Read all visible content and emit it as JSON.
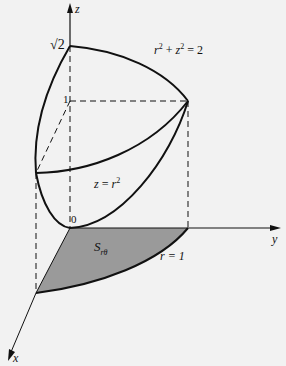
{
  "diagram": {
    "type": "3d-region-figure",
    "axes": {
      "x_label": "x",
      "y_label": "y",
      "z_label": "z",
      "origin_label": "0"
    },
    "z_ticks": {
      "sqrt2": "√2",
      "one": "1"
    },
    "surfaces": {
      "sphere": {
        "lhs": "r",
        "lhs_exp": "2",
        "op": " + ",
        "z": "z",
        "z_exp": "2",
        "rhs": " = 2"
      },
      "paraboloid": {
        "z": "z",
        "eq": " = ",
        "r": "r",
        "exp": "2"
      }
    },
    "region": {
      "name": "S",
      "subscript": "rθ",
      "boundary_label": "r = 1",
      "fill_color": "#9a9a9a"
    },
    "colors": {
      "background": "#f2f2f2",
      "ink": "#111111",
      "shade": "#9a9a9a"
    }
  }
}
